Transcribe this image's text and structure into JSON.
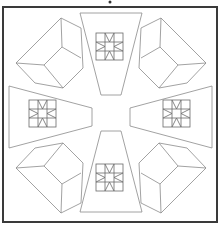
{
  "diagram": {
    "kind": "geometric line pattern",
    "colors": {
      "frame": "#3a3a3a",
      "lines": "#8a8a8a",
      "grid": "#6a6a6a",
      "background": "#ffffff"
    },
    "frame": {
      "x": 3,
      "y": 7,
      "width": 214,
      "height": 215
    },
    "top_mark": {
      "cx": 110,
      "cy": 2,
      "r": 1.5
    },
    "trapezoids": [
      {
        "name": "top",
        "points": "80,13 142,13 121,95 101,95",
        "block": {
          "x": 96,
          "y": 33,
          "size": 27
        }
      },
      {
        "name": "bottom",
        "points": "80,212 142,212 121,131 101,131",
        "block": {
          "x": 96,
          "y": 164,
          "size": 27
        }
      },
      {
        "name": "left",
        "points": "9,86 9,148 92,126 92,108",
        "block": {
          "x": 29,
          "y": 100,
          "size": 27
        }
      },
      {
        "name": "right",
        "points": "212,86 212,148 130,126 130,108",
        "block": {
          "x": 163,
          "y": 100,
          "size": 27
        }
      }
    ],
    "cubes": [
      {
        "name": "top-left",
        "outline": "61,18 16,63 35,83 63,88 83,68 81,28",
        "inner": "61,18 62,47 44,65 16,63 M62,47 81,58 M44,65 63,88"
      },
      {
        "name": "top-right",
        "outline": "161,18 206,63 187,83 159,88 139,68 141,28",
        "inner": "161,18 160,47 178,65 206,63 M160,47 141,58 M178,65 159,88"
      },
      {
        "name": "bottom-left",
        "outline": "61,213 16,168 35,148 63,143 83,163 81,203",
        "inner": "61,213 62,184 44,166 16,168 M62,184 81,173 M44,166 63,143"
      },
      {
        "name": "bottom-right",
        "outline": "161,213 206,168 187,148 159,143 139,163 141,203",
        "inner": "161,213 160,184 178,166 206,168 M160,184 141,173 M178,166 159,143"
      }
    ]
  }
}
